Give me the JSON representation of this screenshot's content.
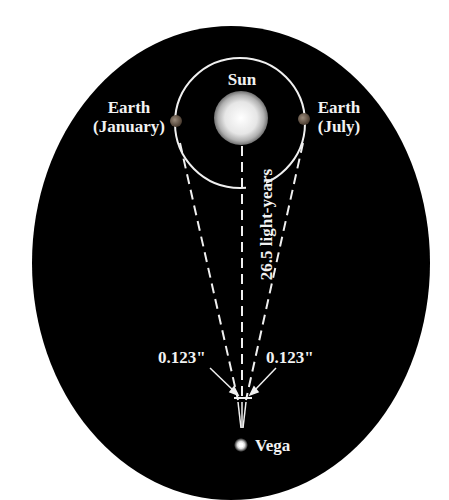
{
  "diagram": {
    "labels": {
      "sun": "Sun",
      "earth_january_line1": "Earth",
      "earth_january_line2": "(January)",
      "earth_july_line1": "Earth",
      "earth_july_line2": "(July)",
      "distance": "26.5 light-years",
      "parallax_left": "0.123\"",
      "parallax_right": "0.123\"",
      "star": "Vega"
    },
    "colors": {
      "background": "#000000",
      "lines": "#f0f0f0",
      "earth": "#6b5a4a"
    }
  }
}
